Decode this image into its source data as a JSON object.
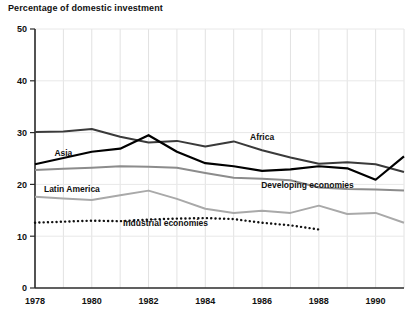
{
  "chart_data": {
    "type": "line",
    "title": "Percentage of domestic investment",
    "xlabel": "",
    "ylabel": "",
    "ylim": [
      0,
      50
    ],
    "xlim": [
      1978,
      1991
    ],
    "yticks": [
      0,
      10,
      20,
      30,
      40,
      50
    ],
    "ytick_labels": [
      "0",
      "10",
      "20",
      "30",
      "40",
      "50"
    ],
    "x": [
      1978,
      1979,
      1980,
      1981,
      1982,
      1983,
      1984,
      1985,
      1986,
      1987,
      1988,
      1989,
      1990,
      1991
    ],
    "xticks": [
      1978,
      1980,
      1982,
      1984,
      1986,
      1988,
      1990
    ],
    "xtick_labels": [
      "1978",
      "1980",
      "1982",
      "1984",
      "1986",
      "1988",
      "1990"
    ],
    "grid": true,
    "legend_position": "inline-annotations",
    "series": [
      {
        "name": "Africa",
        "color": "#3a3a3a",
        "style": "solid",
        "width": 2.0,
        "label_x": 1986.0,
        "label_y": 28.6,
        "values": [
          30.1,
          30.2,
          30.7,
          29.2,
          28.1,
          28.4,
          27.3,
          28.3,
          26.6,
          25.2,
          24.0,
          24.3,
          23.9,
          22.4
        ]
      },
      {
        "name": "Asia",
        "color": "#000000",
        "style": "solid",
        "width": 2.2,
        "label_x": 1979.0,
        "label_y": 25.4,
        "values": [
          23.9,
          25.1,
          26.3,
          26.9,
          29.5,
          26.3,
          24.1,
          23.5,
          22.6,
          22.9,
          23.5,
          23.1,
          20.9,
          25.4
        ]
      },
      {
        "name": "Developing economies",
        "color": "#8c8c8c",
        "style": "solid",
        "width": 2.0,
        "label_x": 1987.6,
        "label_y": 19.3,
        "values": [
          22.8,
          23.0,
          23.2,
          23.5,
          23.4,
          23.2,
          22.2,
          21.3,
          21.1,
          20.8,
          19.4,
          19.1,
          19.0,
          18.8
        ]
      },
      {
        "name": "Latin America",
        "color": "#a9a9a9",
        "style": "solid",
        "width": 2.0,
        "label_x": 1979.3,
        "label_y": 18.6,
        "values": [
          17.6,
          17.3,
          17.0,
          17.9,
          18.8,
          17.2,
          15.3,
          14.5,
          14.9,
          14.5,
          15.9,
          14.3,
          14.5,
          12.6
        ]
      },
      {
        "name": "Industrial economies",
        "color": "#111111",
        "style": "dotted",
        "width": 2.4,
        "label_x": 1982.6,
        "label_y": 12.0,
        "values": [
          12.6,
          12.8,
          13.0,
          12.9,
          13.2,
          13.4,
          13.5,
          13.3,
          12.6,
          12.1,
          11.3,
          null,
          null,
          null
        ]
      }
    ]
  }
}
